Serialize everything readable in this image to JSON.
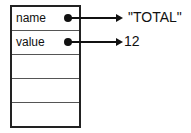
{
  "cells": [
    {
      "label": "name",
      "value": "\"TOTAL\""
    },
    {
      "label": "value",
      "value": "12"
    },
    {
      "label": ""
    },
    {
      "label": ""
    },
    {
      "label": ""
    }
  ]
}
